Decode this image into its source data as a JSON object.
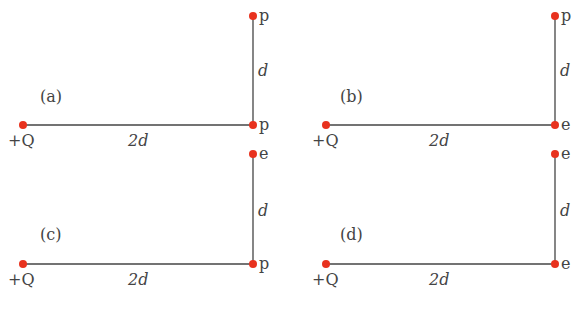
{
  "figure": {
    "caption": "",
    "colors": {
      "charge": "#e8321e",
      "line": "#444444",
      "text": "#444444"
    },
    "panels": [
      {
        "id": "a",
        "label": "(a)",
        "source_label": "+Q",
        "horizontal_label": "2d",
        "vertical_label": "d",
        "corner_particle": "p",
        "top_particle": "p"
      },
      {
        "id": "b",
        "label": "(b)",
        "source_label": "+Q",
        "horizontal_label": "2d",
        "vertical_label": "d",
        "corner_particle": "e",
        "top_particle": "p"
      },
      {
        "id": "c",
        "label": "(c)",
        "source_label": "+Q",
        "horizontal_label": "2d",
        "vertical_label": "d",
        "corner_particle": "p",
        "top_particle": "e"
      },
      {
        "id": "d",
        "label": "(d)",
        "source_label": "+Q",
        "horizontal_label": "2d",
        "vertical_label": "d",
        "corner_particle": "e",
        "top_particle": "e"
      }
    ]
  }
}
